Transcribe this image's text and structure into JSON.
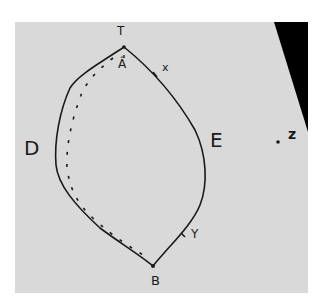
{
  "figure": {
    "type": "hand-drawn sketch",
    "colors": {
      "paper": "#d9d9d9",
      "ink": "#1a1a1a",
      "shadow": "#000000"
    }
  },
  "labels": {
    "top": "T",
    "bottom": "B",
    "left": "D",
    "right": "E",
    "point_x": "x",
    "point_y": "Y",
    "point_z": "z",
    "arrow_mark": "Â"
  }
}
